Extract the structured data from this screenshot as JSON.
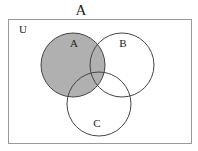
{
  "title": "A",
  "diagram": {
    "type": "venn",
    "universe": {
      "label": "U",
      "x": 8,
      "y": 19,
      "width": 183,
      "height": 124,
      "stroke": "#9a9a9a"
    },
    "sets": [
      {
        "id": "A",
        "label": "A",
        "cx": 73,
        "cy": 65,
        "r": 32,
        "label_x": 74,
        "label_y": 47
      },
      {
        "id": "B",
        "label": "B",
        "cx": 122,
        "cy": 65,
        "r": 32,
        "label_x": 123,
        "label_y": 47
      },
      {
        "id": "C",
        "label": "C",
        "cx": 99,
        "cy": 104,
        "r": 32,
        "label_x": 97,
        "label_y": 127
      }
    ],
    "shaded_region": "A",
    "shade_color": "#b0b0b0",
    "circle_stroke": "#444444"
  }
}
